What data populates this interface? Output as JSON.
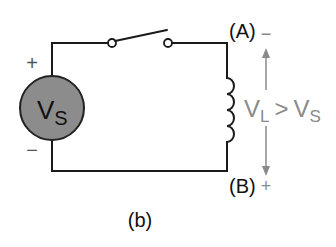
{
  "diagram": {
    "type": "circuit",
    "caption": "(b)",
    "source": {
      "label_main": "V",
      "label_sub": "S",
      "plus_sign": "+",
      "minus_sign": "−",
      "fill_color": "#8c8c8c"
    },
    "switch": {
      "state": "open"
    },
    "inductor": {
      "loops": 4
    },
    "node_a": {
      "label": "(A)",
      "polarity": "−"
    },
    "node_b": {
      "label": "(B)",
      "polarity": "+"
    },
    "relation": {
      "left_main": "V",
      "left_sub": "L",
      "operator": ">",
      "right_main": "V",
      "right_sub": "S",
      "color": "#8a8a8a"
    },
    "colors": {
      "wire": "#1a1a1a",
      "annotation": "#8a8a8a",
      "background": "#ffffff"
    }
  }
}
